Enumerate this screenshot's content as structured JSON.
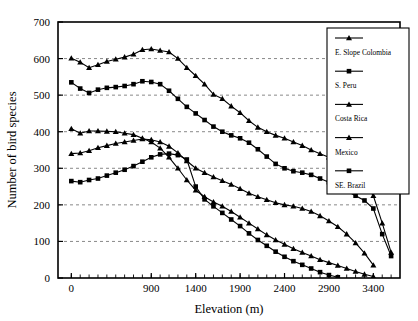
{
  "chart_data": {
    "type": "line",
    "title": "",
    "xlabel": "Elevation (m)",
    "ylabel": "Number of bird species",
    "xlim": [
      -150,
      3700
    ],
    "ylim": [
      0,
      700
    ],
    "xticks": [
      0,
      900,
      1400,
      1900,
      2400,
      2900,
      3400
    ],
    "xtick_labels": [
      "0",
      "900",
      "1400",
      "1900",
      "2400",
      "2900",
      "3400"
    ],
    "xminor_step": 100,
    "yticks": [
      0,
      100,
      200,
      300,
      400,
      500,
      600,
      700
    ],
    "ytick_labels": [
      "0",
      "100",
      "200",
      "300",
      "400",
      "500",
      "600",
      "700"
    ],
    "grid": "horizontal-dashed",
    "legend_position": "right-inside-top",
    "series": [
      {
        "name": "E. Slope Colombia",
        "marker": "triangle",
        "x": [
          0,
          100,
          200,
          300,
          400,
          500,
          600,
          700,
          800,
          900,
          1000,
          1100,
          1200,
          1300,
          1400,
          1500,
          1600,
          1700,
          1800,
          1900,
          2000,
          2100,
          2200,
          2300,
          2400,
          2500,
          2600,
          2700,
          2800,
          2900,
          3000,
          3100,
          3200,
          3300,
          3400,
          3500,
          3600
        ],
        "y": [
          601,
          590,
          575,
          583,
          592,
          598,
          604,
          612,
          624,
          626,
          622,
          618,
          600,
          575,
          553,
          530,
          502,
          490,
          470,
          452,
          430,
          412,
          400,
          390,
          382,
          372,
          362,
          350,
          340,
          330,
          318,
          300,
          282,
          258,
          225,
          150,
          70
        ]
      },
      {
        "name": "S. Peru",
        "marker": "square",
        "x": [
          0,
          100,
          200,
          300,
          400,
          500,
          600,
          700,
          800,
          900,
          1000,
          1100,
          1200,
          1300,
          1400,
          1500,
          1600,
          1700,
          1800,
          1900,
          2000,
          2100,
          2200,
          2300,
          2400,
          2500,
          2600,
          2700,
          2800,
          2900,
          3000,
          3100,
          3200,
          3300,
          3400,
          3500,
          3600
        ],
        "y": [
          535,
          518,
          506,
          515,
          520,
          522,
          525,
          530,
          538,
          536,
          530,
          512,
          490,
          468,
          450,
          432,
          414,
          400,
          390,
          382,
          370,
          352,
          332,
          312,
          300,
          292,
          288,
          282,
          272,
          262,
          250,
          238,
          225,
          212,
          190,
          120,
          60
        ]
      },
      {
        "name": "Costa Rica",
        "marker": "triangle",
        "x": [
          0,
          100,
          200,
          300,
          400,
          500,
          600,
          700,
          800,
          900,
          1000,
          1100,
          1200,
          1300,
          1400,
          1500,
          1600,
          1700,
          1800,
          1900,
          2000,
          2100,
          2200,
          2300,
          2400,
          2500,
          2600,
          2700,
          2800,
          2900,
          3000,
          3100,
          3200,
          3300,
          3400
        ],
        "y": [
          408,
          396,
          402,
          402,
          401,
          400,
          396,
          392,
          382,
          372,
          355,
          330,
          300,
          268,
          240,
          222,
          208,
          196,
          182,
          166,
          150,
          134,
          118,
          104,
          92,
          80,
          70,
          60,
          50,
          42,
          34,
          26,
          18,
          10,
          4
        ]
      },
      {
        "name": "Mexico",
        "marker": "triangle",
        "x": [
          0,
          100,
          200,
          300,
          400,
          500,
          600,
          700,
          800,
          900,
          1000,
          1100,
          1200,
          1300,
          1400,
          1500,
          1600,
          1700,
          1800,
          1900,
          2000,
          2100,
          2200,
          2300,
          2400,
          2500,
          2600,
          2700,
          2800,
          2900,
          3000,
          3100,
          3200,
          3300,
          3400
        ],
        "y": [
          340,
          342,
          348,
          356,
          362,
          368,
          372,
          376,
          380,
          378,
          372,
          360,
          342,
          320,
          300,
          288,
          276,
          266,
          256,
          244,
          232,
          222,
          214,
          206,
          200,
          196,
          190,
          182,
          170,
          156,
          140,
          120,
          96,
          68,
          35
        ]
      },
      {
        "name": "SE. Brazil",
        "marker": "square",
        "x": [
          0,
          100,
          200,
          300,
          400,
          500,
          600,
          700,
          800,
          900,
          1000,
          1100,
          1200,
          1300,
          1400,
          1500,
          1600,
          1700,
          1800,
          1900,
          2000,
          2100,
          2200,
          2300,
          2400,
          2500,
          2600,
          2700,
          2800,
          2900,
          3000
        ],
        "y": [
          265,
          262,
          268,
          272,
          280,
          288,
          296,
          306,
          318,
          330,
          338,
          340,
          336,
          324,
          250,
          215,
          196,
          178,
          160,
          142,
          122,
          104,
          88,
          72,
          58,
          46,
          36,
          26,
          16,
          8,
          2
        ]
      }
    ]
  }
}
